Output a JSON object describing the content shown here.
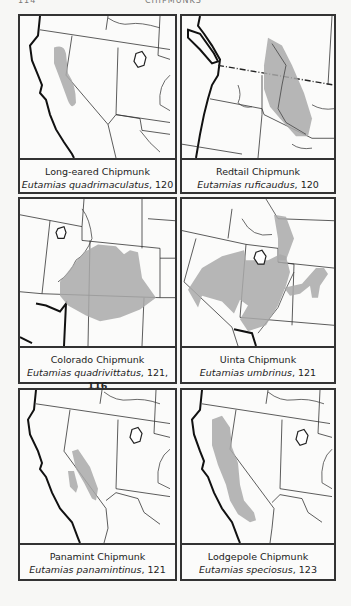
{
  "page_header": {
    "page_number": "114",
    "title": "CHIPMUNKS"
  },
  "panels": [
    {
      "common_name": "Long-eared Chipmunk",
      "scientific_name": "Eutamias quadrimaculatus",
      "page_refs": ", 120",
      "plate_ref": ""
    },
    {
      "common_name": "Redtail Chipmunk",
      "scientific_name": "Eutamias ruficaudus",
      "page_refs": ", 120",
      "plate_ref": ""
    },
    {
      "common_name": "Colorado Chipmunk",
      "scientific_name": "Eutamias quadrivittatus",
      "page_refs": ", 121, ",
      "plate_ref": "116"
    },
    {
      "common_name": "Uinta Chipmunk",
      "scientific_name": "Eutamias umbrinus",
      "page_refs": ", 121",
      "plate_ref": ""
    },
    {
      "common_name": "Panamint Chipmunk",
      "scientific_name": "Eutamias panamintinus",
      "page_refs": ", 121",
      "plate_ref": ""
    },
    {
      "common_name": "Lodgepole Chipmunk",
      "scientific_name": "Eutamias speciosus",
      "page_refs": ", 123",
      "plate_ref": ""
    }
  ],
  "colors": {
    "range_fill": "#a9a9a9",
    "border": "#333333",
    "background": "#f7f7f5"
  }
}
